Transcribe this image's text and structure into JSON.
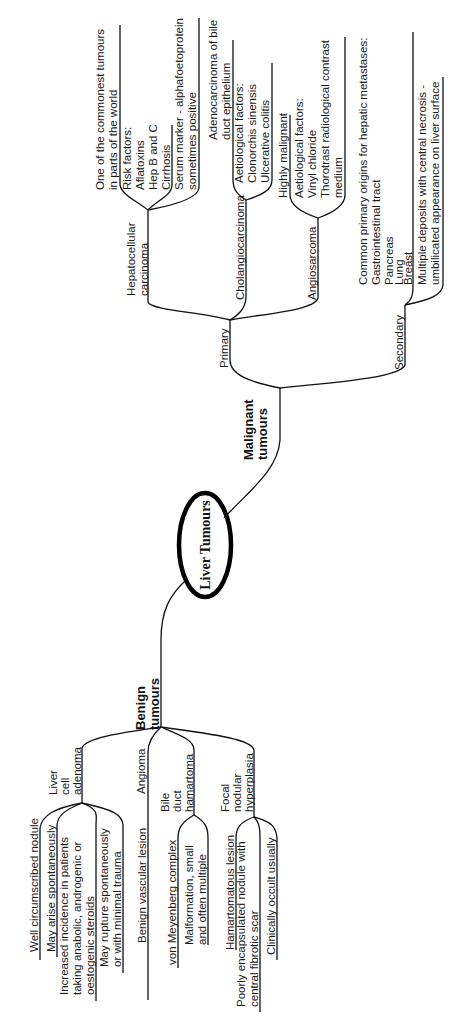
{
  "root": {
    "label": "Liver Tumours"
  },
  "malignant": {
    "label_line1": "Malignant",
    "label_line2": "tumours",
    "primary": {
      "label": "Primary",
      "hepatocellular": {
        "label_line1": "Hepatocellular",
        "label_line2": "carcinoma",
        "notes": [
          [
            "One of the commonest tumours",
            "in parts of the world"
          ],
          [
            "Risk factors:",
            "Aflatoxins",
            "Hep B and C",
            "Cirrhosis"
          ],
          [
            "Serum marker - alphafoetoprotein",
            "sometimes positive"
          ]
        ]
      },
      "cholangiocarcinoma": {
        "label": "Cholangiocarcinoma",
        "notes": [
          [
            "Adenocarcinoma of bile",
            "duct epithelium"
          ],
          [
            "Aetiological factors:",
            "Clonorchis sinensis",
            "Ulcerative colitis"
          ]
        ]
      },
      "angiosarcoma": {
        "label": "Angiosarcoma",
        "notes": [
          [
            "Highly malignant"
          ],
          [
            "Aetiological factors:",
            "Vinyl chloride",
            "Thorotrast radiological contrast",
            "medium"
          ]
        ]
      }
    },
    "secondary": {
      "label": "Secondary",
      "notes": [
        [
          "Common primary origins for hepatic metastases:",
          "Gastrointestinal tract",
          "Pancreas",
          "Lung",
          "Breast"
        ],
        [
          "Multiple deposits with central necrosis -",
          "umbilicated appearance on liver surface"
        ]
      ]
    }
  },
  "benign": {
    "label_line1": "Benign",
    "label_line2": "tumours",
    "liver_cell_adenoma": {
      "label_lines": [
        "Liver",
        "cell",
        "adenoma"
      ],
      "notes": [
        [
          "Well circumscribed nodule"
        ],
        [
          "May arise spontaneously"
        ],
        [
          "Increased incidence in patients",
          "taking anabolic, androgenic or",
          "oestogenic steroids"
        ],
        [
          "May rupture spontaneously",
          "or with minimal trauma"
        ]
      ]
    },
    "angioma": {
      "label": "Angioma",
      "notes": [
        [
          "Benign vascular lesion"
        ]
      ]
    },
    "bile_duct_hamartoma": {
      "label_lines": [
        "Bile",
        "duct",
        "hamartoma"
      ],
      "notes": [
        [
          "von Meyenberg complex"
        ],
        [
          "Malformation, small",
          "and often multiple"
        ]
      ]
    },
    "focal_nodular_hyperplasia": {
      "label_lines": [
        "Focal",
        "nodular",
        "hyperplasia"
      ],
      "notes": [
        [
          "Hamartomatous lesion"
        ],
        [
          "Poorly encapsulated nodule with",
          "central fibrotic scar"
        ],
        [
          "Clinically occult usually"
        ]
      ]
    }
  }
}
